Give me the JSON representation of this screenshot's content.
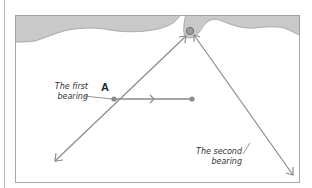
{
  "diagram": {
    "type": "navigation-bearing-fix",
    "point_label": "A",
    "labels": {
      "first_bearing_line1": "The first",
      "first_bearing_line2": "bearing",
      "second_bearing_line1": "The second",
      "second_bearing_line2": "bearing"
    },
    "colors": {
      "land": "#c9c9c9",
      "land_edge": "#9a9a9a",
      "lines": "#8a8a8a",
      "frame": "#a8a8a8",
      "landmark_fill": "#9d9d9d",
      "landmark_ring": "#6e6e6e"
    },
    "elements": [
      {
        "id": "coastline",
        "kind": "land-mass"
      },
      {
        "id": "landmark",
        "kind": "circle",
        "x": 190,
        "y": 31
      },
      {
        "id": "first-bearing",
        "kind": "line",
        "from": [
          55,
          161
        ],
        "to": [
          186,
          36
        ]
      },
      {
        "id": "course-line",
        "kind": "line",
        "from": [
          114,
          99
        ],
        "to": [
          192,
          99
        ]
      },
      {
        "id": "second-bearing",
        "kind": "line",
        "from": [
          194,
          35
        ],
        "to": [
          293,
          175
        ]
      }
    ]
  }
}
